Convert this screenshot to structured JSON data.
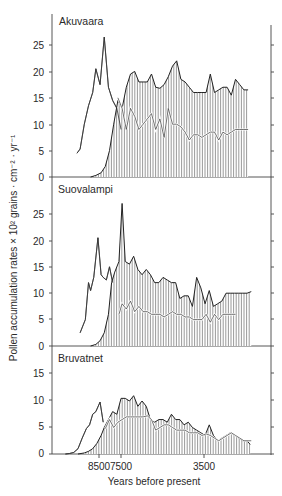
{
  "chart_data": [
    {
      "type": "area",
      "title": "Akuvaara",
      "xlabel": "Years before present",
      "ylabel": "Pollen accumulation rates × 10² grains · cm⁻² · yr⁻¹",
      "yticks": [
        0,
        5,
        10,
        15,
        20,
        25
      ],
      "ylim": [
        0,
        28
      ],
      "xlim": [
        10100,
        600
      ],
      "series": [
        {
          "name": "unhatched curve (early taxon)",
          "style": "line",
          "x": [
            9550,
            9400,
            9200,
            9000,
            8800,
            8650,
            8450,
            8250,
            8050,
            7850,
            7650,
            7450
          ],
          "values": [
            4.5,
            5.3,
            10,
            13.5,
            16,
            20.5,
            17.5,
            26.5,
            17,
            14.5,
            13,
            9
          ]
        },
        {
          "name": "hatched area (total)",
          "style": "hatched-area",
          "x": [
            8900,
            8650,
            8400,
            8200,
            8000,
            7800,
            7600,
            7400,
            7200,
            7000,
            6800,
            6600,
            6400,
            6200,
            6000,
            5800,
            5600,
            5400,
            5200,
            5000,
            4800,
            4600,
            4400,
            4200,
            4000,
            3800,
            3600,
            3400,
            3200,
            3000,
            2800,
            2600,
            2400,
            2200,
            2000,
            1800,
            1600,
            1400
          ],
          "values": [
            0,
            0.3,
            0.8,
            2,
            5,
            10,
            14.5,
            13,
            17,
            19.5,
            20,
            18,
            18,
            18,
            19.5,
            17,
            16.8,
            17.5,
            19,
            21,
            22,
            18.5,
            18,
            17,
            16,
            16,
            16,
            16,
            19.5,
            16,
            16.5,
            17,
            17,
            15.5,
            18.5,
            17.5,
            16.5,
            16.5
          ]
        },
        {
          "name": "white inner line",
          "style": "line",
          "x": [
            7600,
            7400,
            7200,
            7000,
            6800,
            6600,
            6400,
            6200,
            6000,
            5800,
            5600,
            5400,
            5200,
            5000,
            4800,
            4600,
            4400,
            4200,
            4000,
            3800,
            3600,
            3400,
            3200,
            3000,
            2800,
            2600,
            2400,
            2200,
            2000,
            1800,
            1600,
            1400
          ],
          "values": [
            15,
            13,
            9,
            13,
            11.5,
            9,
            10,
            11,
            12,
            9,
            11,
            7.5,
            13,
            10,
            10,
            9.5,
            8.5,
            7,
            8,
            8,
            7.5,
            8,
            8.5,
            8.5,
            7,
            8.5,
            8,
            8.5,
            9,
            9,
            9,
            9
          ]
        }
      ]
    },
    {
      "type": "area",
      "title": "Suovalampi",
      "xlabel": "Years before present",
      "ylabel": "Pollen accumulation rates × 10² grains · cm⁻² · yr⁻¹",
      "yticks": [
        0,
        5,
        10,
        15,
        20,
        25
      ],
      "ylim": [
        0,
        28
      ],
      "xlim": [
        10100,
        600
      ],
      "series": [
        {
          "name": "unhatched curve (early taxon)",
          "style": "line",
          "x": [
            9400,
            9150,
            9000,
            8900,
            8750,
            8550,
            8400,
            8300,
            8150,
            8000,
            7850
          ],
          "values": [
            2.5,
            5,
            12,
            10.5,
            13,
            20.5,
            13.5,
            13,
            12.5,
            15,
            12
          ]
        },
        {
          "name": "hatched area (total)",
          "style": "hatched-area",
          "x": [
            8900,
            8650,
            8450,
            8250,
            8050,
            7900,
            7750,
            7550,
            7400,
            7250,
            7050,
            6850,
            6650,
            6450,
            6250,
            6050,
            5850,
            5650,
            5450,
            5250,
            5050,
            4850,
            4650,
            4450,
            4250,
            4050,
            3850,
            3650,
            3450,
            3250,
            3050,
            2850,
            2650,
            2450,
            2250,
            2050,
            1850,
            1650,
            1450,
            1250
          ],
          "values": [
            0,
            0.3,
            1,
            2.5,
            6,
            12,
            14,
            16,
            27,
            16,
            15.5,
            17,
            14.5,
            13.5,
            14.5,
            13.5,
            12,
            12,
            13,
            12.5,
            12,
            12,
            9,
            9.5,
            9.5,
            7.5,
            13,
            11,
            8,
            10.5,
            7.5,
            8,
            8.5,
            10,
            10,
            10,
            10,
            10,
            10,
            10.3
          ]
        },
        {
          "name": "white inner line",
          "style": "line",
          "x": [
            7550,
            7400,
            7200,
            7000,
            6800,
            6600,
            6400,
            6200,
            6000,
            5800,
            5600,
            5400,
            5200,
            5000,
            4800,
            4600,
            4400,
            4200,
            4000,
            3800,
            3600,
            3400,
            3200,
            3000,
            2800,
            2600,
            2400,
            2200,
            2000
          ],
          "values": [
            6,
            8,
            7,
            8.5,
            6.5,
            7.5,
            6.5,
            6.5,
            6,
            6,
            6,
            5.5,
            6,
            6.5,
            6,
            6,
            5.5,
            5.5,
            5,
            5,
            5,
            6,
            4.5,
            6,
            5,
            6,
            6,
            6,
            6
          ]
        }
      ]
    },
    {
      "type": "area",
      "title": "Bruvatnet",
      "xlabel": "Years before present",
      "ylabel": "Pollen accumulation rates × 10² grains · cm⁻² · yr⁻¹",
      "yticks": [
        0,
        5,
        10,
        15
      ],
      "ylim": [
        0,
        16
      ],
      "xlim": [
        10100,
        600
      ],
      "xticks": [
        8500,
        7500,
        3500
      ],
      "series": [
        {
          "name": "unhatched curve (early taxon)",
          "style": "line",
          "x": [
            10100,
            9900,
            9700,
            9500,
            9300,
            9100,
            8950,
            8800,
            8650,
            8450,
            8300
          ],
          "values": [
            0,
            0.1,
            0.3,
            1,
            3,
            4.8,
            5.5,
            7.5,
            8,
            9.8,
            6
          ]
        },
        {
          "name": "hatched area (total)",
          "style": "hatched-area",
          "x": [
            9500,
            9200,
            9000,
            8800,
            8600,
            8400,
            8250,
            8050,
            7850,
            7650,
            7450,
            7250,
            7050,
            6850,
            6650,
            6450,
            6250,
            6050,
            5850,
            5650,
            5450,
            5250,
            5050,
            4850,
            4650,
            4450,
            4250,
            4050,
            3850,
            3650,
            3450,
            3250,
            3050,
            2850,
            2650,
            2450,
            2250,
            2050,
            1850,
            1650,
            1450,
            1300
          ],
          "values": [
            0,
            0.2,
            0.5,
            1,
            2,
            3.5,
            5,
            6.5,
            8,
            7.5,
            10.5,
            10.5,
            10,
            11,
            9,
            10,
            9,
            6.5,
            6,
            6.5,
            6.5,
            6,
            7.5,
            6.5,
            6.5,
            5.5,
            6,
            5,
            4.5,
            4,
            3.5,
            5.5,
            3.5,
            2.5,
            3,
            3.5,
            4,
            3.5,
            3,
            2.5,
            2.5,
            1.8
          ]
        },
        {
          "name": "white inner line",
          "style": "line",
          "x": [
            8200,
            8000,
            7800,
            7600,
            7400,
            7200,
            7000,
            6800,
            6600,
            6400,
            6200,
            6000,
            5800,
            5600,
            5400,
            5200,
            5000,
            4800,
            4600,
            4400,
            4200,
            4000,
            3800,
            3600,
            3400,
            3200,
            3000,
            2800,
            2600,
            2400,
            2200,
            2000,
            1800,
            1600,
            1400,
            1250
          ],
          "values": [
            4.8,
            6.5,
            5,
            6,
            6.5,
            7,
            7,
            7,
            7,
            7,
            7.2,
            6.5,
            4.5,
            5,
            5.5,
            5.5,
            5,
            4.5,
            4.5,
            4.5,
            4,
            4,
            4,
            3.5,
            3.8,
            3.5,
            3,
            2.5,
            3,
            3.5,
            4,
            3.5,
            3,
            2.5,
            2.5,
            2.5
          ]
        }
      ]
    }
  ],
  "axes": {
    "x_axis_title": "Years before present",
    "x_tick_labels": [
      "8500",
      "7500",
      "3500"
    ],
    "y_axis_title": "Pollen accumulation rates × 10² grains · cm⁻² · yr⁻¹"
  },
  "panels": [
    {
      "site": "Akuvaara",
      "y_tick_labels": [
        "25",
        "20",
        "15",
        "10",
        "5",
        "0"
      ]
    },
    {
      "site": "Suovalampi",
      "y_tick_labels": [
        "25",
        "20",
        "15",
        "10",
        "5",
        "0"
      ]
    },
    {
      "site": "Bruvatnet",
      "y_tick_labels": [
        "15",
        "10",
        "5",
        "0"
      ]
    }
  ]
}
